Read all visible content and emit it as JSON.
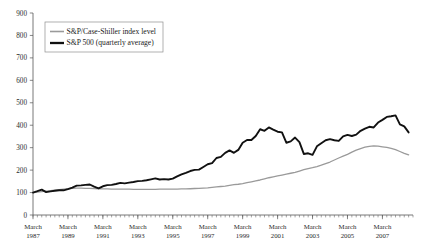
{
  "chart_data": {
    "type": "line",
    "title": "",
    "subtitle": "",
    "xlabel": "",
    "ylabel": "",
    "ylim": [
      0,
      900
    ],
    "y_ticks": [
      0,
      100,
      200,
      300,
      400,
      500,
      600,
      700,
      800,
      900
    ],
    "grid": false,
    "legend_position": "top-left",
    "x_tick_month": "March",
    "x_tick_years": [
      "1987",
      "1989",
      "1991",
      "1993",
      "1995",
      "1997",
      "1999",
      "2001",
      "2003",
      "2005",
      "2007"
    ],
    "x_tick_labels": [
      "March 1987",
      "March 1989",
      "March 1991",
      "March 1993",
      "March 1995",
      "March 1997",
      "March 1999",
      "March 2001",
      "March 2003",
      "March 2005",
      "March 2007"
    ],
    "x_range": [
      "March 1987",
      "December 2008"
    ],
    "x_minor_tick_interval": "quarterly",
    "series": [
      {
        "name": "S&P/Case-Shiller index level",
        "color": "#9a9a9a",
        "width": 1.3,
        "x": [
          "1987Q1",
          "1987Q2",
          "1987Q3",
          "1987Q4",
          "1988Q1",
          "1988Q2",
          "1988Q3",
          "1988Q4",
          "1989Q1",
          "1989Q2",
          "1989Q3",
          "1989Q4",
          "1990Q1",
          "1990Q2",
          "1990Q3",
          "1990Q4",
          "1991Q1",
          "1991Q2",
          "1991Q3",
          "1991Q4",
          "1992Q1",
          "1992Q2",
          "1992Q3",
          "1992Q4",
          "1993Q1",
          "1993Q2",
          "1993Q3",
          "1993Q4",
          "1994Q1",
          "1994Q2",
          "1994Q3",
          "1994Q4",
          "1995Q1",
          "1995Q2",
          "1995Q3",
          "1995Q4",
          "1996Q1",
          "1996Q2",
          "1996Q3",
          "1996Q4",
          "1997Q1",
          "1997Q2",
          "1997Q3",
          "1997Q4",
          "1998Q1",
          "1998Q2",
          "1998Q3",
          "1998Q4",
          "1999Q1",
          "1999Q2",
          "1999Q3",
          "1999Q4",
          "2000Q1",
          "2000Q2",
          "2000Q3",
          "2000Q4",
          "2001Q1",
          "2001Q2",
          "2001Q3",
          "2001Q4",
          "2002Q1",
          "2002Q2",
          "2002Q3",
          "2002Q4",
          "2003Q1",
          "2003Q2",
          "2003Q3",
          "2003Q4",
          "2004Q1",
          "2004Q2",
          "2004Q3",
          "2004Q4",
          "2005Q1",
          "2005Q2",
          "2005Q3",
          "2005Q4",
          "2006Q1",
          "2006Q2",
          "2006Q3",
          "2006Q4",
          "2007Q1",
          "2007Q2",
          "2007Q3",
          "2007Q4",
          "2008Q1",
          "2008Q2",
          "2008Q3"
        ],
        "values": [
          100,
          102,
          104,
          106,
          108,
          111,
          113,
          115,
          117,
          119,
          120,
          120,
          119,
          119,
          118,
          117,
          116,
          116,
          115,
          115,
          115,
          115,
          115,
          114,
          114,
          114,
          114,
          114,
          114,
          115,
          115,
          115,
          115,
          115,
          116,
          116,
          117,
          118,
          119,
          120,
          121,
          123,
          125,
          127,
          129,
          132,
          135,
          137,
          140,
          144,
          148,
          152,
          156,
          161,
          166,
          170,
          174,
          178,
          182,
          186,
          190,
          196,
          202,
          207,
          211,
          216,
          222,
          229,
          236,
          245,
          254,
          262,
          270,
          280,
          289,
          296,
          302,
          306,
          308,
          307,
          304,
          301,
          297,
          291,
          283,
          275,
          268
        ]
      },
      {
        "name": "S&P 500 (quarterly average)",
        "color": "#111111",
        "width": 1.9,
        "x": [
          "1987Q1",
          "1987Q2",
          "1987Q3",
          "1987Q4",
          "1988Q1",
          "1988Q2",
          "1988Q3",
          "1988Q4",
          "1989Q1",
          "1989Q2",
          "1989Q3",
          "1989Q4",
          "1990Q1",
          "1990Q2",
          "1990Q3",
          "1990Q4",
          "1991Q1",
          "1991Q2",
          "1991Q3",
          "1991Q4",
          "1992Q1",
          "1992Q2",
          "1992Q3",
          "1992Q4",
          "1993Q1",
          "1993Q2",
          "1993Q3",
          "1993Q4",
          "1994Q1",
          "1994Q2",
          "1994Q3",
          "1994Q4",
          "1995Q1",
          "1995Q2",
          "1995Q3",
          "1995Q4",
          "1996Q1",
          "1996Q2",
          "1996Q3",
          "1996Q4",
          "1997Q1",
          "1997Q2",
          "1997Q3",
          "1997Q4",
          "1998Q1",
          "1998Q2",
          "1998Q3",
          "1998Q4",
          "1999Q1",
          "1999Q2",
          "1999Q3",
          "1999Q4",
          "2000Q1",
          "2000Q2",
          "2000Q3",
          "2000Q4",
          "2001Q1",
          "2001Q2",
          "2001Q3",
          "2001Q4",
          "2002Q1",
          "2002Q2",
          "2002Q3",
          "2002Q4",
          "2003Q1",
          "2003Q2",
          "2003Q3",
          "2003Q4",
          "2004Q1",
          "2004Q2",
          "2004Q3",
          "2004Q4",
          "2005Q1",
          "2005Q2",
          "2005Q3",
          "2005Q4",
          "2006Q1",
          "2006Q2",
          "2006Q3",
          "2006Q4",
          "2007Q1",
          "2007Q2",
          "2007Q3",
          "2007Q4",
          "2008Q1",
          "2008Q2",
          "2008Q3"
        ],
        "values": [
          100,
          106,
          113,
          102,
          105,
          108,
          110,
          110,
          115,
          122,
          131,
          132,
          134,
          136,
          126,
          119,
          128,
          133,
          134,
          138,
          143,
          141,
          144,
          147,
          151,
          152,
          155,
          159,
          163,
          158,
          160,
          158,
          162,
          172,
          181,
          188,
          196,
          201,
          202,
          214,
          226,
          231,
          254,
          259,
          277,
          288,
          277,
          290,
          322,
          334,
          334,
          352,
          382,
          375,
          390,
          380,
          371,
          368,
          322,
          328,
          345,
          325,
          272,
          275,
          268,
          306,
          320,
          333,
          338,
          333,
          330,
          350,
          357,
          352,
          358,
          375,
          385,
          393,
          390,
          412,
          424,
          437,
          440,
          444,
          404,
          395,
          368
        ]
      }
    ]
  },
  "legend": {
    "items": [
      {
        "label": "S&P/Case-Shiller index level",
        "color": "#9a9a9a",
        "swatch": "gray-line-swatch"
      },
      {
        "label": "S&P 500 (quarterly average)",
        "color": "#111111",
        "swatch": "black-line-swatch"
      }
    ]
  }
}
